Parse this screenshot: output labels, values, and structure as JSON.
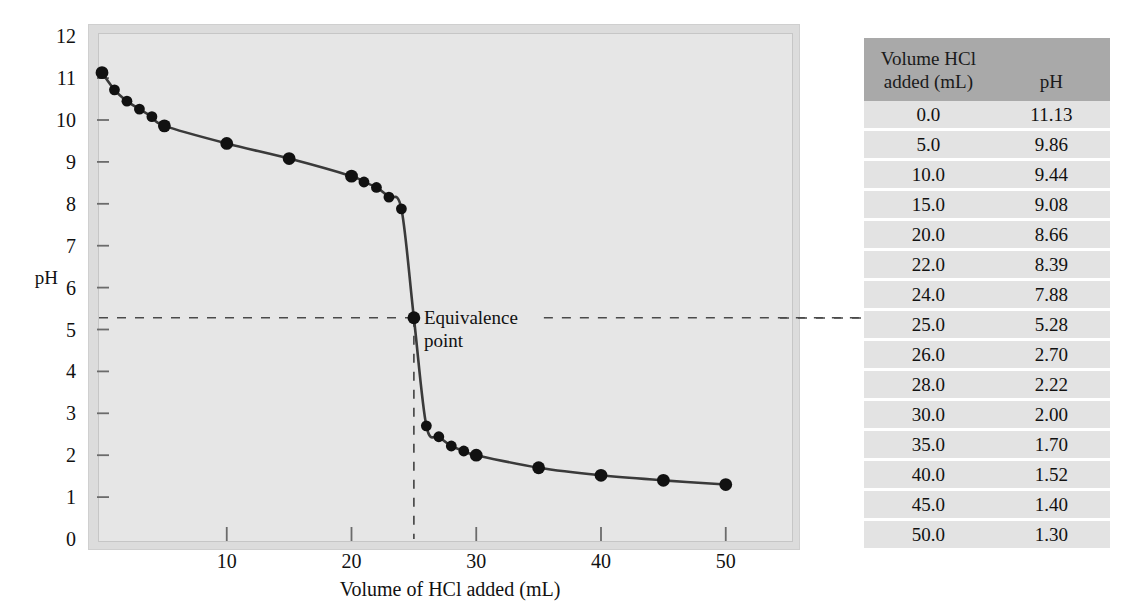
{
  "chart_data": {
    "type": "line",
    "title": "",
    "xlabel": "Volume of HCl added (mL)",
    "ylabel": "pH",
    "xlim": [
      0,
      55
    ],
    "ylim": [
      0,
      12
    ],
    "xticks": [
      10,
      20,
      30,
      40,
      50
    ],
    "yticks": [
      0,
      1,
      2,
      3,
      4,
      5,
      6,
      7,
      8,
      9,
      10,
      11,
      12
    ],
    "grid": false,
    "legend": null,
    "marker": "filled-circle",
    "x": [
      0.0,
      1.0,
      2.0,
      3.0,
      4.0,
      5.0,
      10.0,
      15.0,
      20.0,
      21.0,
      22.0,
      23.0,
      24.0,
      25.0,
      26.0,
      27.0,
      28.0,
      29.0,
      30.0,
      35.0,
      40.0,
      45.0,
      50.0
    ],
    "y": [
      11.13,
      10.72,
      10.45,
      10.26,
      10.08,
      9.86,
      9.44,
      9.08,
      8.66,
      8.52,
      8.39,
      8.16,
      7.88,
      5.28,
      2.7,
      2.44,
      2.22,
      2.1,
      2.0,
      1.7,
      1.52,
      1.4,
      1.3
    ],
    "annotations": [
      {
        "label": "Equivalence\npoint",
        "label_line1": "Equivalence",
        "label_line2": "point",
        "x": 25.0,
        "y": 5.28,
        "guide_horizontal": true,
        "guide_vertical": true
      }
    ],
    "series": [
      {
        "name": "Titration of weak base with HCl",
        "x": [
          0.0,
          1.0,
          2.0,
          3.0,
          4.0,
          5.0,
          10.0,
          15.0,
          20.0,
          21.0,
          22.0,
          23.0,
          24.0,
          25.0,
          26.0,
          27.0,
          28.0,
          29.0,
          30.0,
          35.0,
          40.0,
          45.0,
          50.0
        ],
        "values": [
          11.13,
          10.72,
          10.45,
          10.26,
          10.08,
          9.86,
          9.44,
          9.08,
          8.66,
          8.52,
          8.39,
          8.16,
          7.88,
          5.28,
          2.7,
          2.44,
          2.22,
          2.1,
          2.0,
          1.7,
          1.52,
          1.4,
          1.3
        ]
      }
    ]
  },
  "axis": {
    "y_label": "pH",
    "x_label": "Volume of HCl added (mL)",
    "y_ticks": [
      "12",
      "11",
      "10",
      "9",
      "8",
      "7",
      "6",
      "5",
      "4",
      "3",
      "2",
      "1",
      "0"
    ],
    "x_ticks": [
      "10",
      "20",
      "30",
      "40",
      "50"
    ]
  },
  "annotation": {
    "equivalence_line1": "Equivalence",
    "equivalence_line2": "point"
  },
  "table": {
    "header": {
      "volume_line1": "Volume HCl",
      "volume_line2": "added (mL)",
      "ph": "pH"
    },
    "rows": [
      {
        "volume": "0.0",
        "ph": "11.13"
      },
      {
        "volume": "5.0",
        "ph": "9.86"
      },
      {
        "volume": "10.0",
        "ph": "9.44"
      },
      {
        "volume": "15.0",
        "ph": "9.08"
      },
      {
        "volume": "20.0",
        "ph": "8.66"
      },
      {
        "volume": "22.0",
        "ph": "8.39"
      },
      {
        "volume": "24.0",
        "ph": "7.88"
      },
      {
        "volume": "25.0",
        "ph": "5.28"
      },
      {
        "volume": "26.0",
        "ph": "2.70"
      },
      {
        "volume": "28.0",
        "ph": "2.22"
      },
      {
        "volume": "30.0",
        "ph": "2.00"
      },
      {
        "volume": "35.0",
        "ph": "1.70"
      },
      {
        "volume": "40.0",
        "ph": "1.52"
      },
      {
        "volume": "45.0",
        "ph": "1.40"
      },
      {
        "volume": "50.0",
        "ph": "1.30"
      }
    ]
  },
  "colors": {
    "curve": "#3a3a3a",
    "marker": "#111111",
    "plot_background": "#e6e6e6",
    "frame": "#dcdcdc",
    "table_header": "#a9a9a9",
    "table_row": "#e3e3e3",
    "guide_line": "#4a4a4a"
  }
}
